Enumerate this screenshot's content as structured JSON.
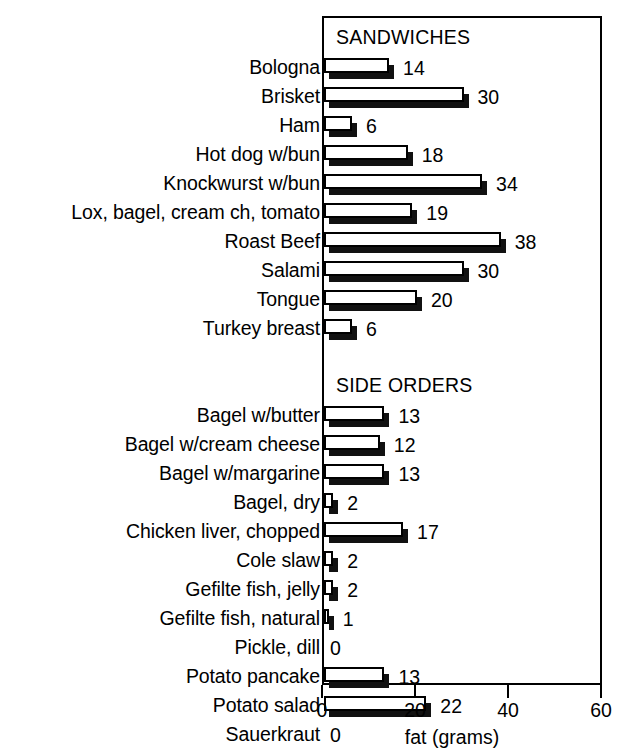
{
  "chart_data": {
    "type": "bar",
    "orientation": "horizontal",
    "title": "",
    "xlabel": "fat (grams)",
    "ylabel": "",
    "xlim": [
      0,
      60
    ],
    "xticks": [
      0,
      20,
      40,
      60
    ],
    "xtick_labels": [
      "0",
      "20",
      "40",
      "60"
    ],
    "grid": false,
    "legend": null,
    "value_labels": true,
    "sections": [
      {
        "name": "SANDWICHES",
        "categories": [
          "Bologna",
          "Brisket",
          "Ham",
          "Hot dog w/bun",
          "Knockwurst w/bun",
          "Lox, bagel, cream ch, tomato",
          "Roast Beef",
          "Salami",
          "Tongue",
          "Turkey breast"
        ],
        "values": [
          14,
          30,
          6,
          18,
          34,
          19,
          38,
          30,
          20,
          6
        ]
      },
      {
        "name": "SIDE ORDERS",
        "categories": [
          "Bagel w/butter",
          "Bagel w/cream cheese",
          "Bagel w/margarine",
          "Bagel, dry",
          "Chicken liver, chopped",
          "Cole slaw",
          "Gefilte fish, jelly",
          "Gefilte fish, natural",
          "Pickle, dill",
          "Potato pancake",
          "Potato salad",
          "Sauerkraut"
        ],
        "values": [
          13,
          12,
          13,
          2,
          17,
          2,
          2,
          1,
          0,
          13,
          22,
          0
        ]
      }
    ],
    "categories": [
      "Bologna",
      "Brisket",
      "Ham",
      "Hot dog w/bun",
      "Knockwurst w/bun",
      "Lox, bagel, cream ch, tomato",
      "Roast Beef",
      "Salami",
      "Tongue",
      "Turkey breast",
      "Bagel w/butter",
      "Bagel w/cream cheese",
      "Bagel w/margarine",
      "Bagel, dry",
      "Chicken liver, chopped",
      "Cole slaw",
      "Gefilte fish, jelly",
      "Gefilte fish, natural",
      "Pickle, dill",
      "Potato pancake",
      "Potato salad",
      "Sauerkraut"
    ],
    "values": [
      14,
      30,
      6,
      18,
      34,
      19,
      38,
      30,
      20,
      6,
      13,
      12,
      13,
      2,
      17,
      2,
      2,
      1,
      0,
      13,
      22,
      0
    ],
    "colors": {
      "bar_face": "#ffffff",
      "bar_outline": "#000000",
      "bar_shadow": "#111111",
      "axis": "#000000",
      "text": "#000000",
      "background": "#ffffff"
    }
  },
  "layout": {
    "plot_left_px": 322,
    "plot_top_px": 16,
    "plot_width_px": 280,
    "plot_height_px": 669,
    "row_height_px": 29,
    "px_per_unit": 4.65
  }
}
